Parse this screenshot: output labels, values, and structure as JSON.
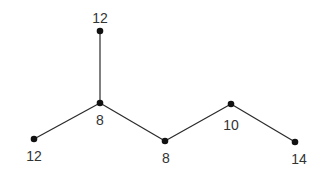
{
  "diagram": {
    "type": "tree-graph",
    "nodes": [
      {
        "id": "n_top",
        "x": 100,
        "y": 31,
        "label": "12",
        "lx": 100,
        "ly": 23
      },
      {
        "id": "n_center",
        "x": 100,
        "y": 103,
        "label": "8",
        "lx": 100,
        "ly": 125
      },
      {
        "id": "n_left",
        "x": 34,
        "y": 139,
        "label": "12",
        "lx": 34,
        "ly": 161
      },
      {
        "id": "n_mid",
        "x": 165,
        "y": 141,
        "label": "8",
        "lx": 166,
        "ly": 163
      },
      {
        "id": "n_rmid",
        "x": 231,
        "y": 104,
        "label": "10",
        "lx": 231,
        "ly": 130
      },
      {
        "id": "n_right",
        "x": 295,
        "y": 142,
        "label": "14",
        "lx": 299,
        "ly": 164
      }
    ],
    "edges": [
      [
        "n_top",
        "n_center"
      ],
      [
        "n_center",
        "n_left"
      ],
      [
        "n_center",
        "n_mid"
      ],
      [
        "n_mid",
        "n_rmid"
      ],
      [
        "n_rmid",
        "n_right"
      ]
    ],
    "colors": {
      "edge": "#2a2a2a",
      "node": "#111111",
      "label": "#333333"
    }
  }
}
